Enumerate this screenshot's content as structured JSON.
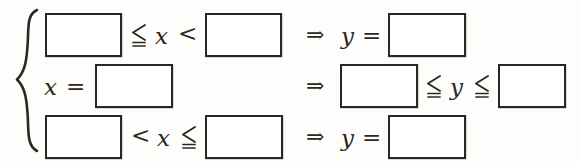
{
  "document": {
    "kind": "math-piecewise-fill-in-the-blank",
    "brace": "{",
    "colors": {
      "ink": "#2b2823",
      "box_border": "#2a2723",
      "box_fill": "#ffffff",
      "page_background": "#fdfdfb"
    }
  },
  "symbols": {
    "leq_double": "≦",
    "less_than": "<",
    "implies": "⇒",
    "equals": "=",
    "x": "x",
    "y": "y"
  },
  "rows": [
    {
      "id": "row-1",
      "condition": {
        "lower_blank": "",
        "rel_left": "≦",
        "variable": "x",
        "rel_right": "<",
        "upper_blank": ""
      },
      "implies": "⇒",
      "result": {
        "variable": "y",
        "equals": "=",
        "value_blank": ""
      }
    },
    {
      "id": "row-2",
      "condition": {
        "variable": "x",
        "equals": "=",
        "value_blank": ""
      },
      "implies": "⇒",
      "result": {
        "lower_blank": "",
        "rel_left": "≦",
        "variable": "y",
        "rel_right": "≦",
        "upper_blank": ""
      }
    },
    {
      "id": "row-3",
      "condition": {
        "lower_blank": "",
        "rel_left": "<",
        "variable": "x",
        "rel_right": "≦",
        "upper_blank": ""
      },
      "implies": "⇒",
      "result": {
        "variable": "y",
        "equals": "=",
        "value_blank": ""
      }
    }
  ]
}
